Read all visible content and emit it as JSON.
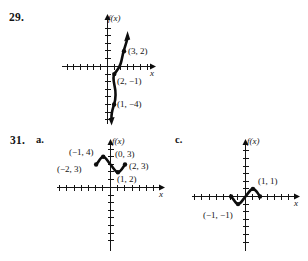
{
  "page": {
    "background_color": "#ffffff",
    "ink_color": "#141414"
  },
  "problems": [
    {
      "id": "problem-29",
      "number": "29.",
      "part": "",
      "graph": {
        "x_axis_label": "x",
        "y_axis_label": "f(x)",
        "points": [
          {
            "label": "(3, 2)",
            "x": 3,
            "y": 2
          },
          {
            "label": "(2, −1)",
            "x": 2,
            "y": -1
          },
          {
            "label": "(1, −4)",
            "x": 1,
            "y": -4
          }
        ],
        "x_range": [
          -7,
          7
        ],
        "y_range": [
          -7,
          6
        ],
        "description": "increasing cubic-like curve with arrows at both ends"
      }
    },
    {
      "id": "problem-31a",
      "number": "31.",
      "part": "a.",
      "graph": {
        "x_axis_label": "x",
        "y_axis_label": "f(x)",
        "points": [
          {
            "label": "(−1, 4)",
            "x": -1,
            "y": 4
          },
          {
            "label": "(−2, 3)",
            "x": -2,
            "y": 3
          },
          {
            "label": "(0, 3)",
            "x": 0,
            "y": 3
          },
          {
            "label": "(2, 3)",
            "x": 2,
            "y": 3
          },
          {
            "label": "(1, 2)",
            "x": 1,
            "y": 2
          }
        ],
        "x_range": [
          -7,
          7
        ],
        "y_range": [
          -7,
          6
        ],
        "description": "wave segment from (-2,3) up to (-1,4) down to (1,2) up to (2,3)"
      }
    },
    {
      "id": "problem-31c",
      "number": "",
      "part": "c.",
      "graph": {
        "x_axis_label": "x",
        "y_axis_label": "f(x)",
        "points": [
          {
            "label": "(1, 1)",
            "x": 1,
            "y": 1
          },
          {
            "label": "(−1, −1)",
            "x": -1,
            "y": -1
          }
        ],
        "x_range": [
          -7,
          7
        ],
        "y_range": [
          -7,
          6
        ],
        "description": "wave segment from (-2,0) down to (-1,-1) up to (1,1) down to (2,0)"
      }
    }
  ]
}
